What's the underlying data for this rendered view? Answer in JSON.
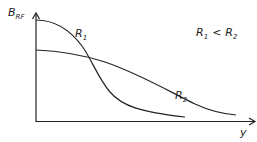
{
  "diagram": {
    "y_axis_label": "B",
    "y_axis_label_sub": "RF",
    "x_axis_label": "y",
    "relation": {
      "left": "R",
      "left_sub": "1",
      "op": "<",
      "right": "R",
      "right_sub": "2"
    },
    "curves": [
      {
        "name": "R",
        "sub": "1",
        "description": "starts high, falls steeply"
      },
      {
        "name": "R",
        "sub": "2",
        "description": "starts lower, falls gradually"
      }
    ],
    "colors": {
      "line": "#222222",
      "background": "#ffffff"
    }
  }
}
